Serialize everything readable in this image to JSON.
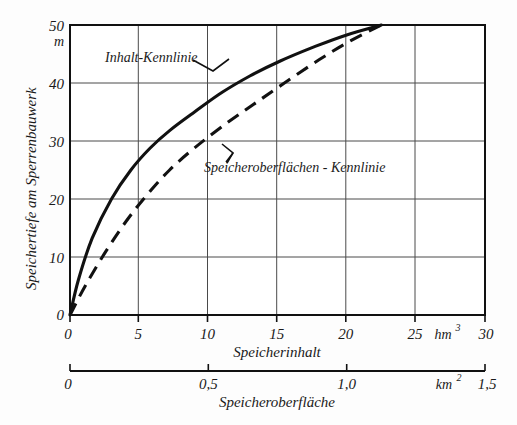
{
  "chart_data": {
    "type": "line",
    "title": "",
    "subtitle": "",
    "grid": true,
    "legend_position": "inline-annotations",
    "ylabel": "Speichertiefe am Sperrenbauwerk",
    "yunit": "m",
    "ylim": [
      0,
      50
    ],
    "yticks": [
      0,
      10,
      20,
      30,
      40,
      50
    ],
    "ytick_labels": [
      "0",
      "10",
      "20",
      "30",
      "40",
      "50"
    ],
    "xlabel": "Speicherinhalt",
    "xunit": "hm",
    "xunit_exponent": "3",
    "xlim": [
      0,
      30
    ],
    "xticks": [
      0,
      5,
      10,
      15,
      20,
      25,
      30
    ],
    "xtick_labels": [
      "0",
      "5",
      "10",
      "15",
      "20",
      "25",
      "30"
    ],
    "secondary_xlabel": "Speicheroberfläche",
    "secondary_xunit": "km",
    "secondary_xunit_exponent": "2",
    "secondary_xlim": [
      0,
      1.5
    ],
    "secondary_xticks": [
      0,
      0.5,
      1.0,
      1.5
    ],
    "secondary_xtick_labels": [
      "0",
      "0,5",
      "1,0",
      "1,5"
    ],
    "series": [
      {
        "name": "Inhalt-Kennlinie",
        "style": "solid",
        "color": "#111111",
        "x": [
          0,
          0.6,
          1.6,
          3.0,
          4.4,
          5.8,
          7.2,
          9.0,
          11.0,
          13.0,
          15.2,
          17.5,
          20.0,
          22.5
        ],
        "y": [
          0,
          6.0,
          13.2,
          20.0,
          25.0,
          28.8,
          31.8,
          35.0,
          38.4,
          41.2,
          43.8,
          46.1,
          48.3,
          50.0
        ]
      },
      {
        "name": "Speicheroberflächen - Kennlinie",
        "style": "dashed",
        "color": "#111111",
        "x": [
          0,
          1.1,
          2.6,
          4.1,
          5.6,
          7.2,
          9.0,
          11.0,
          13.2,
          15.5,
          18.0,
          20.3,
          22.5
        ],
        "y": [
          0,
          5.0,
          11.0,
          16.3,
          20.8,
          25.0,
          28.8,
          32.5,
          36.2,
          40.0,
          44.0,
          47.3,
          50.0
        ]
      }
    ],
    "annotations": [
      {
        "text": "Inhalt-Kennlinie",
        "x_px": 105,
        "y_px": 57
      },
      {
        "text": "Speicheroberflächen - Kennlinie",
        "x_px": 203,
        "y_px": 167
      }
    ]
  }
}
